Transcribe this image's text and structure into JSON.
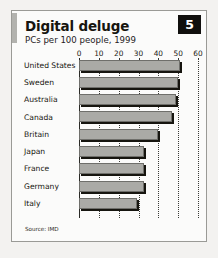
{
  "card": {
    "badge_number": "5",
    "title": "Digital deluge",
    "subtitle": "PCs per 100 people, 1999",
    "source": "Source: IMD"
  },
  "chart_data": {
    "type": "bar",
    "orientation": "horizontal",
    "title": "Digital deluge",
    "subtitle": "PCs per 100 people, 1999",
    "xlabel": "",
    "ylabel": "",
    "xlim": [
      0,
      60
    ],
    "xticks": [
      0,
      10,
      20,
      30,
      40,
      50,
      60
    ],
    "xtick_labels": [
      "0",
      "10",
      "20",
      "30",
      "40",
      "50",
      "60"
    ],
    "grid": "vertical-dotted",
    "legend": "none",
    "categories": [
      "United States",
      "Sweden",
      "Australia",
      "Canada",
      "Britain",
      "Japan",
      "France",
      "Germany",
      "Italy"
    ],
    "values": [
      51,
      50,
      49,
      47,
      40,
      33,
      33,
      33,
      29
    ],
    "series": [
      {
        "name": "PCs per 100 people, 1999",
        "values": [
          51,
          50,
          49,
          47,
          40,
          33,
          33,
          33,
          29
        ]
      }
    ],
    "colors": {
      "bar_fill": "#aaaaa6",
      "bar_shadow": "#16150f",
      "badge_background": "#100f0d",
      "badge_text": "#ffffff",
      "text": "#17150f"
    }
  }
}
